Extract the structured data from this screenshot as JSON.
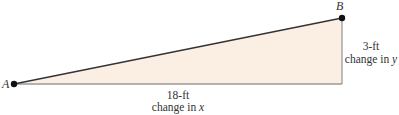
{
  "diagram": {
    "type": "right-triangle-slope",
    "points": {
      "A": {
        "label": "A"
      },
      "B": {
        "label": "B"
      }
    },
    "horizontal_leg": {
      "measure": "18-ft",
      "caption_prefix": "change in ",
      "caption_var": "x"
    },
    "vertical_leg": {
      "measure": "3-ft",
      "caption_prefix": "change in ",
      "caption_var": "y"
    },
    "colors": {
      "fill": "#FBEFE4",
      "hypotenuse": "#333333",
      "legs": "#9a9a9a",
      "points": "#111111"
    }
  }
}
